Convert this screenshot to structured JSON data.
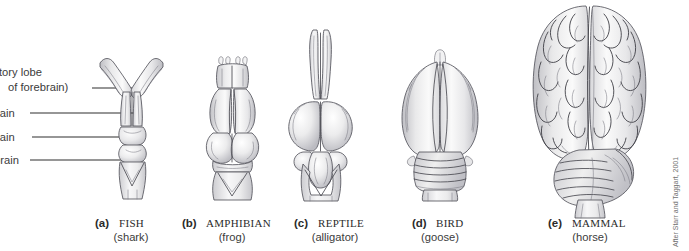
{
  "figure": {
    "background_color": "#ffffff",
    "credit": "After Starr and Taggart, 2001"
  },
  "labels": [
    {
      "id": "olfactory-lobe",
      "line1": "olfactory lobe",
      "line2": "(part of forebrain)",
      "visible_line1": "tory lobe",
      "visible_line2": "of forebrain)",
      "leader_y": 93
    },
    {
      "id": "forebrain",
      "line1": "forebrain",
      "visible_line1": "rain",
      "leader_y": 113
    },
    {
      "id": "midbrain",
      "line1": "midbrain",
      "visible_line1": "rain",
      "leader_y": 137
    },
    {
      "id": "hindbrain",
      "line1": "hindbrain",
      "visible_line1": "brain",
      "leader_y": 160
    }
  ],
  "specimens": [
    {
      "letter": "(a)",
      "group": "FISH",
      "common": "(shark)",
      "cx": 131
    },
    {
      "letter": "(b)",
      "group": "AMPHIBIAN",
      "common": "(frog)",
      "cx": 232
    },
    {
      "letter": "(c)",
      "group": "REPTILE",
      "common": "(alligator)",
      "cx": 335
    },
    {
      "letter": "(d)",
      "group": "BIRD",
      "common": "(goose)",
      "cx": 440
    },
    {
      "letter": "(e)",
      "group": "MAMMAL",
      "common": "(horse)",
      "cx": 590
    }
  ],
  "colors": {
    "outline": "#55555d",
    "text": "#3b3b3b",
    "leader": "#2e2e2e",
    "credit": "#6f6f6f",
    "fill_light": "#f4f4f4",
    "fill_mid": "#e3e3e4",
    "fill_shade": "#cfcfd2"
  }
}
